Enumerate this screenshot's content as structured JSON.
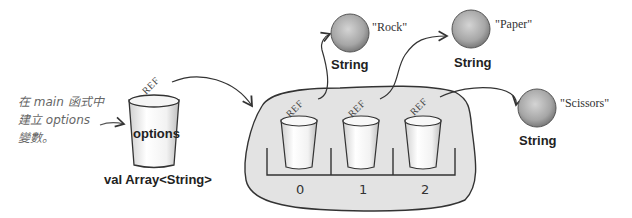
{
  "annotation": {
    "lines": [
      "在 main 函式中",
      "建立 options",
      "變數。"
    ]
  },
  "variable": {
    "cup_label": "options",
    "type_label": "val Array<String>",
    "ref_label": "REF"
  },
  "array": {
    "slots": [
      {
        "index": "0",
        "ref_label": "REF"
      },
      {
        "index": "1",
        "ref_label": "REF"
      },
      {
        "index": "2",
        "ref_label": "REF"
      }
    ]
  },
  "objects": [
    {
      "value": "\"Rock\"",
      "type": "String"
    },
    {
      "value": "\"Paper\"",
      "type": "String"
    },
    {
      "value": "\"Scissors\"",
      "type": "String"
    }
  ],
  "colors": {
    "blob_fill": "#e3e3e3",
    "outline": "#333333",
    "sphere": "#a8a8a8",
    "annotation_text": "#666666"
  }
}
